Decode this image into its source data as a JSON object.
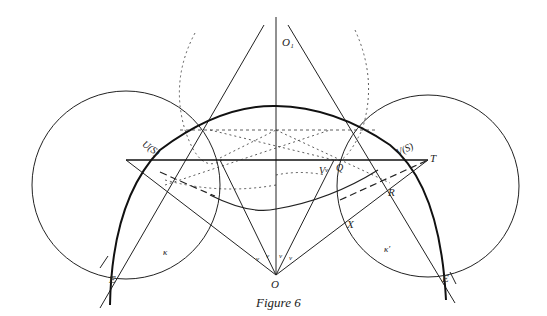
{
  "caption": "Figure 6",
  "colors": {
    "ink": "#222222",
    "background": "#ffffff"
  },
  "labels": {
    "O1": "O₁",
    "O": "O",
    "E_left": "E",
    "E_right": "E",
    "U_S": "U(S)",
    "V_S": "V(S)",
    "T": "T",
    "Q": "Q",
    "R": "R",
    "X": "X",
    "V_point": "V",
    "kappa": "κ",
    "kappa_prime": "κ′",
    "angle_mark": "ν"
  }
}
